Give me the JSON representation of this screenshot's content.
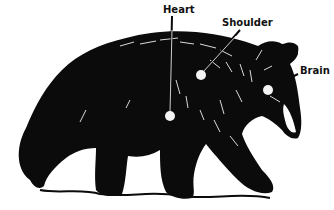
{
  "diagram": {
    "labels": [
      {
        "text": "Heart",
        "x": 165,
        "y": 5
      },
      {
        "text": "Shoulder",
        "x": 222,
        "y": 18
      },
      {
        "text": "Brain",
        "x": 300,
        "y": 66
      }
    ],
    "markers": [
      {
        "name": "heart",
        "cx": 170,
        "cy": 116,
        "r": 5
      },
      {
        "name": "shoulder",
        "cx": 201,
        "cy": 75,
        "r": 5
      },
      {
        "name": "brain",
        "cx": 268,
        "cy": 90,
        "r": 5
      }
    ],
    "colors": {
      "ink": "#0b0b0b",
      "paper": "#ffffff",
      "marker": "#f4f4f4"
    }
  }
}
